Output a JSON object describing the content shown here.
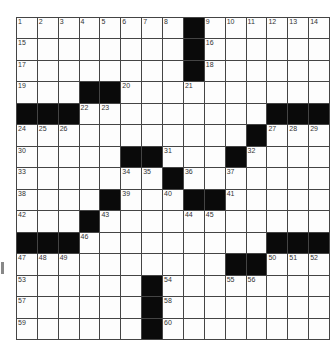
{
  "puzzle": {
    "rows": 15,
    "cols": 15,
    "grid": [
      "........#......",
      "........#......",
      "........#......",
      "...##..........",
      "###.........###",
      "...........#...",
      ".....##...#....",
      ".......#.......",
      "....#...##.....",
      "...#...........",
      "###.........###",
      "..........##...",
      "......#........",
      "......#........",
      "......#........"
    ],
    "visible_numbers": [
      1,
      2,
      3,
      4,
      5,
      6,
      7,
      8,
      9,
      10,
      11,
      12,
      13,
      14,
      15,
      16,
      17,
      18,
      19,
      20,
      21,
      22,
      23,
      24,
      25,
      26,
      27,
      28,
      29,
      30,
      31,
      32,
      33,
      34,
      35,
      36,
      37,
      38,
      39,
      40,
      41,
      42,
      43,
      44,
      45,
      46,
      47,
      48,
      49,
      50,
      51,
      52,
      53,
      54,
      55,
      56,
      57,
      58,
      59,
      60
    ]
  },
  "colors": {
    "block": "#0a0a0a",
    "cell": "#fdfdfd",
    "line": "#444444"
  }
}
